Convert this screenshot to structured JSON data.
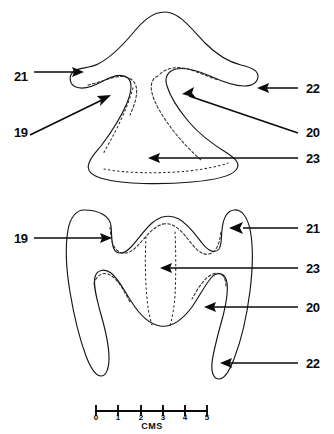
{
  "figure": {
    "background_color": "#ffffff",
    "ink_color": "#161616",
    "description_top": "upper specimen view",
    "description_bottom": "lower specimen view"
  },
  "labels": {
    "top_view": [
      {
        "id": "21",
        "text": "21",
        "side": "left",
        "x": 14,
        "y": 76
      },
      {
        "id": "19",
        "text": "19",
        "side": "left",
        "x": 14,
        "y": 132
      },
      {
        "id": "22",
        "text": "22",
        "side": "right",
        "x": 306,
        "y": 92
      },
      {
        "id": "20",
        "text": "20",
        "side": "right",
        "x": 306,
        "y": 132
      },
      {
        "id": "23",
        "text": "23",
        "side": "right",
        "x": 306,
        "y": 159
      }
    ],
    "bottom_view": [
      {
        "id": "19",
        "text": "19",
        "side": "left",
        "x": 14,
        "y": 242
      },
      {
        "id": "21",
        "text": "21",
        "side": "right",
        "x": 306,
        "y": 232
      },
      {
        "id": "23",
        "text": "23",
        "side": "right",
        "x": 306,
        "y": 272
      },
      {
        "id": "20",
        "text": "20",
        "side": "right",
        "x": 306,
        "y": 311
      },
      {
        "id": "22",
        "text": "22",
        "side": "right",
        "x": 306,
        "y": 367
      }
    ]
  },
  "scale_bar": {
    "unit_label": "CMS",
    "ticks": [
      "0",
      "1",
      "2",
      "3",
      "4",
      "5"
    ],
    "tick_values": [
      0,
      1,
      2,
      3,
      4,
      5
    ],
    "min": 0,
    "max": 5,
    "x_start": 95,
    "x_end": 208,
    "y": 411
  }
}
